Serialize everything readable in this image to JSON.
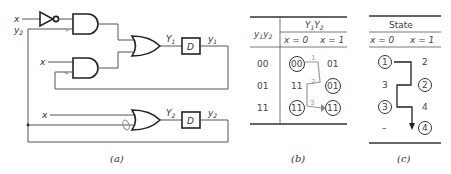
{
  "figure_a": {
    "caption": "(a)",
    "inputs": {
      "x_top": "x",
      "y2_top": "y",
      "y2_top_sub": "2",
      "x_mid": "x",
      "x_bottom": "x"
    },
    "gates": [
      {
        "id": "inverter",
        "type": "NOT"
      },
      {
        "id": "and1",
        "type": "AND"
      },
      {
        "id": "and2",
        "type": "AND"
      },
      {
        "id": "or1",
        "type": "OR"
      },
      {
        "id": "or2",
        "type": "OR"
      }
    ],
    "flipflops": [
      {
        "id": "d1",
        "label": "D",
        "input": "Y",
        "input_sub": "1",
        "output": "y",
        "output_sub": "1"
      },
      {
        "id": "d2",
        "label": "D",
        "input": "Y",
        "input_sub": "2",
        "output": "y",
        "output_sub": "2"
      }
    ]
  },
  "figure_b": {
    "caption": "(b)",
    "row_header": "y",
    "row_header_sub1": "1",
    "row_header_y2": "y",
    "row_header_sub2": "2",
    "col_header": "Y",
    "col_header_sub1": "1",
    "col_header_Y2": "Y",
    "col_header_sub2": "2",
    "columns": [
      "x = 0",
      "x = 1"
    ],
    "rows": [
      {
        "state": "00",
        "x0": "00",
        "x0_circled": true,
        "x1": "01",
        "x1_circled": false
      },
      {
        "state": "01",
        "x0": "11",
        "x0_circled": false,
        "x1": "01",
        "x1_circled": true
      },
      {
        "state": "11",
        "x0": "11",
        "x0_circled": true,
        "x1": "11",
        "x1_circled": true
      }
    ],
    "annotations": [
      "1",
      "2",
      "3"
    ]
  },
  "figure_c": {
    "caption": "(c)",
    "header": "State",
    "columns": [
      "x = 0",
      "x = 1"
    ],
    "rows": [
      {
        "x0": "1",
        "x0_circled": true,
        "x1": "2",
        "x1_circled": false
      },
      {
        "x0": "3",
        "x0_circled": false,
        "x1": "2",
        "x1_circled": true
      },
      {
        "x0": "3",
        "x0_circled": true,
        "x1": "4",
        "x1_circled": false
      },
      {
        "x0": "–",
        "x0_circled": false,
        "x1": "4",
        "x1_circled": true
      }
    ]
  }
}
